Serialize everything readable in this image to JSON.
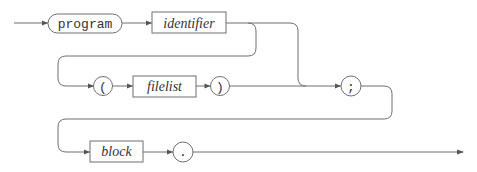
{
  "diagram": {
    "type": "railroad-syntax-diagram",
    "nodes": [
      {
        "id": "program",
        "kind": "terminal",
        "label": "program"
      },
      {
        "id": "identifier",
        "kind": "nonterminal",
        "label": "identifier"
      },
      {
        "id": "lparen",
        "kind": "terminal",
        "label": "("
      },
      {
        "id": "filelist",
        "kind": "nonterminal",
        "label": "filelist"
      },
      {
        "id": "rparen",
        "kind": "terminal",
        "label": ")"
      },
      {
        "id": "semicolon",
        "kind": "terminal",
        "label": ";"
      },
      {
        "id": "block",
        "kind": "nonterminal",
        "label": "block"
      },
      {
        "id": "period",
        "kind": "terminal",
        "label": "."
      }
    ],
    "edges": [
      [
        "start",
        "program"
      ],
      [
        "program",
        "identifier"
      ],
      [
        "identifier",
        "lparen"
      ],
      [
        "identifier",
        "semicolon"
      ],
      [
        "lparen",
        "filelist"
      ],
      [
        "filelist",
        "rparen"
      ],
      [
        "rparen",
        "semicolon"
      ],
      [
        "semicolon",
        "block"
      ],
      [
        "block",
        "period"
      ],
      [
        "period",
        "end"
      ]
    ]
  }
}
